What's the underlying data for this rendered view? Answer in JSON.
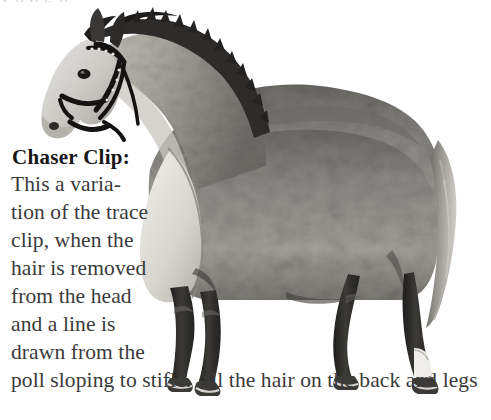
{
  "page": {
    "background_color": "#ffffff",
    "text_color": "#3a3a3a",
    "heading_color": "#161616",
    "partial_top_line": "y  p   p  g                      p",
    "width": 491,
    "height": 420
  },
  "figure": {
    "name": "horse-chaser-clip-photo",
    "colors": {
      "coat_light": "#cfcdc9",
      "coat_mid": "#8e8c88",
      "coat_dark": "#55534f",
      "legs_dark": "#2b2a28",
      "unclipped_belly": "#ded9d2",
      "mane_dark": "#2e2c2a",
      "bridle": "#141312",
      "hoof": "#3c3a37",
      "sock_white": "#efeeeb"
    }
  },
  "caption": {
    "heading": "Chaser Clip:",
    "lines": [
      "This a varia-",
      "tion of the trace",
      "clip, when the",
      "hair is removed",
      "from the head",
      "and a line is",
      "drawn from the",
      "poll sloping to stifle. All the hair on the back and legs"
    ],
    "full_text": "Chaser Clip: This a variation of the trace clip, when the hair is removed from the head and a line is drawn from the poll sloping to stifle. All the hair on the back and legs"
  }
}
